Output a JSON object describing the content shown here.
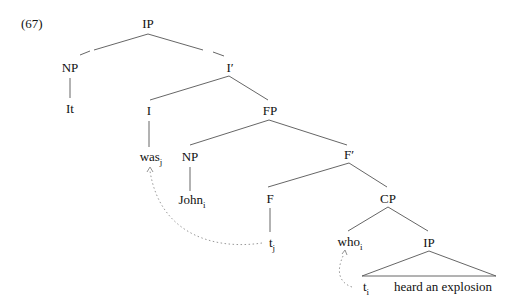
{
  "example_number": "(67)",
  "tree": {
    "nodes": [
      {
        "id": "IP_root",
        "label": "IP",
        "sub": ""
      },
      {
        "id": "NP_it",
        "label": "NP",
        "sub": ""
      },
      {
        "id": "It",
        "label": "It",
        "sub": ""
      },
      {
        "id": "Ibar",
        "label": "I′",
        "sub": ""
      },
      {
        "id": "I",
        "label": "I",
        "sub": ""
      },
      {
        "id": "was",
        "label": "was",
        "sub": "j"
      },
      {
        "id": "FP",
        "label": "FP",
        "sub": ""
      },
      {
        "id": "NP_john",
        "label": "NP",
        "sub": ""
      },
      {
        "id": "John",
        "label": "John",
        "sub": "i"
      },
      {
        "id": "Fbar",
        "label": "F′",
        "sub": ""
      },
      {
        "id": "F",
        "label": "F",
        "sub": ""
      },
      {
        "id": "t_j",
        "label": "t",
        "sub": "j"
      },
      {
        "id": "CP",
        "label": "CP",
        "sub": ""
      },
      {
        "id": "who",
        "label": "who",
        "sub": "i"
      },
      {
        "id": "IP_low",
        "label": "IP",
        "sub": ""
      },
      {
        "id": "t_i",
        "label": "t",
        "sub": "i"
      },
      {
        "id": "heard",
        "label": "heard an explosion",
        "sub": ""
      }
    ],
    "movement_arrows": [
      {
        "from": "t_j",
        "to": "was",
        "style": "dotted"
      },
      {
        "from": "t_i",
        "to": "who",
        "style": "dotted"
      }
    ]
  },
  "colors": {
    "line": "#555555",
    "dotted": "#999999",
    "text": "#111111"
  }
}
